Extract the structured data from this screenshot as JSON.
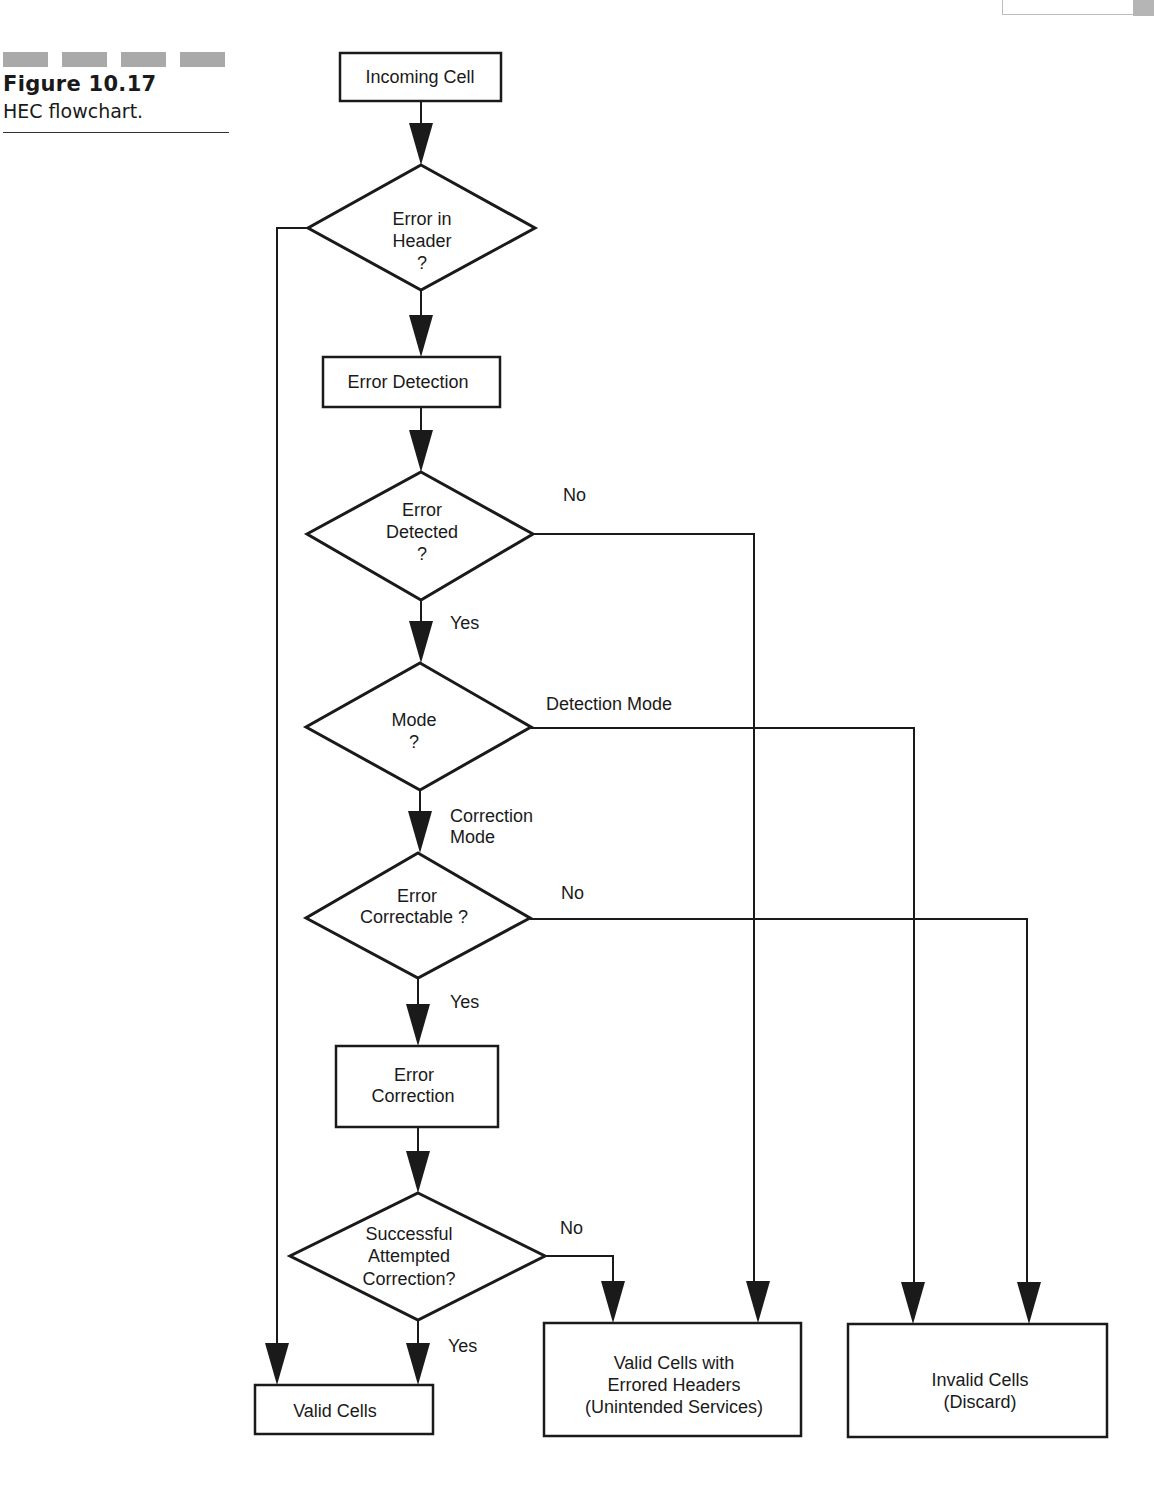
{
  "figure": {
    "number": "Figure 10.17",
    "caption": "HEC flowchart."
  },
  "nodes": {
    "incoming_cell": {
      "type": "process",
      "lines": [
        "Incoming Cell"
      ]
    },
    "error_in_header": {
      "type": "decision",
      "lines": [
        "Error in",
        "Header",
        "?"
      ]
    },
    "error_detection": {
      "type": "process",
      "lines": [
        "Error Detection"
      ]
    },
    "error_detected": {
      "type": "decision",
      "lines": [
        "Error",
        "Detected",
        "?"
      ]
    },
    "mode": {
      "type": "decision",
      "lines": [
        "Mode",
        "?"
      ]
    },
    "error_correctable": {
      "type": "decision",
      "lines": [
        "Error",
        "Correctable ?"
      ]
    },
    "error_correction": {
      "type": "process",
      "lines": [
        "Error",
        "Correction"
      ]
    },
    "successful_correction": {
      "type": "decision",
      "lines": [
        "Successful",
        "Attempted",
        "Correction?"
      ]
    },
    "valid_cells": {
      "type": "terminal",
      "lines": [
        "Valid Cells"
      ]
    },
    "valid_errored": {
      "type": "terminal",
      "lines": [
        "Valid Cells with",
        "Errored Headers",
        "(Unintended Services)"
      ]
    },
    "invalid_cells": {
      "type": "terminal",
      "lines": [
        "Invalid Cells",
        "(Discard)"
      ]
    }
  },
  "edge_labels": {
    "error_detected_no": "No",
    "error_detected_yes": "Yes",
    "mode_detection": "Detection Mode",
    "mode_correction_1": "Correction",
    "mode_correction_2": "Mode",
    "correctable_no": "No",
    "correctable_yes": "Yes",
    "successful_no": "No",
    "successful_yes": "Yes"
  },
  "edges": [
    {
      "from": "incoming_cell",
      "to": "error_in_header"
    },
    {
      "from": "error_in_header",
      "to": "error_detection",
      "label": ""
    },
    {
      "from": "error_in_header",
      "to": "valid_cells",
      "label": ""
    },
    {
      "from": "error_detection",
      "to": "error_detected"
    },
    {
      "from": "error_detected",
      "to": "mode",
      "label": "Yes"
    },
    {
      "from": "error_detected",
      "to": "valid_errored",
      "label": "No"
    },
    {
      "from": "mode",
      "to": "error_correctable",
      "label": "Correction Mode"
    },
    {
      "from": "mode",
      "to": "invalid_cells",
      "label": "Detection Mode"
    },
    {
      "from": "error_correctable",
      "to": "error_correction",
      "label": "Yes"
    },
    {
      "from": "error_correctable",
      "to": "invalid_cells",
      "label": "No"
    },
    {
      "from": "error_correction",
      "to": "successful_correction"
    },
    {
      "from": "successful_correction",
      "to": "valid_cells",
      "label": "Yes"
    },
    {
      "from": "successful_correction",
      "to": "valid_errored",
      "label": "No"
    }
  ]
}
